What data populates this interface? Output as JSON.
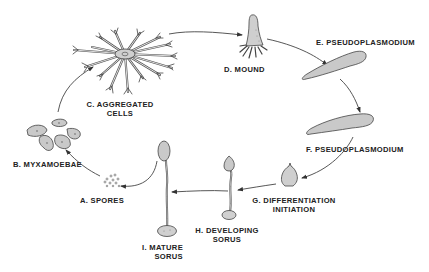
{
  "diagram": {
    "type": "life-cycle",
    "colors": {
      "ink": "#333333",
      "fill": "#c9c9c9",
      "background": "#ffffff",
      "text": "#222222"
    },
    "stages": [
      {
        "id": "A",
        "label": "A. SPORES"
      },
      {
        "id": "B",
        "label": "B. MYXAMOEBAE"
      },
      {
        "id": "C",
        "label_line1": "C. AGGREGATED",
        "label_line2": "CELLS"
      },
      {
        "id": "D",
        "label": "D. MOUND"
      },
      {
        "id": "E",
        "label": "E. PSEUDOPLASMODIUM"
      },
      {
        "id": "F",
        "label": "F. PSEUDOPLASMODIUM"
      },
      {
        "id": "G",
        "label_line1": "G. DIFFERENTIATION",
        "label_line2": "INITIATION"
      },
      {
        "id": "H",
        "label_line1": "H. DEVELOPING",
        "label_line2": "SORUS"
      },
      {
        "id": "I",
        "label_line1": "I. MATURE",
        "label_line2": "SORUS"
      }
    ],
    "flow": [
      "A→B",
      "B→C",
      "C→D",
      "D→E",
      "E→F",
      "F→G",
      "G→H",
      "H→I",
      "I→A"
    ]
  }
}
